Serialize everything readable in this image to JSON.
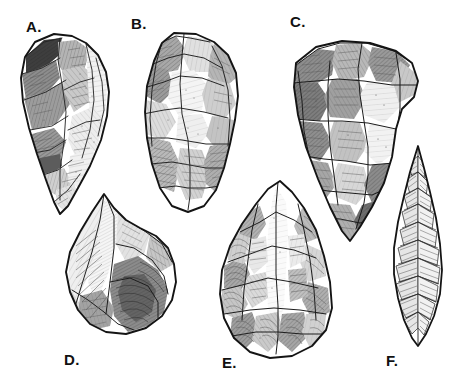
{
  "plate": {
    "title": "Lithic artifact illustration plate",
    "description": "Six hand-drawn archaeological stone tool (lithic) illustrations rendered in black ink hatching on white, each labeled with a letter.",
    "background_color": "#ffffff",
    "ink_color": "#1a1a1a",
    "width": 470,
    "height": 385
  },
  "figures": [
    {
      "id": "a",
      "label": "A.",
      "name": "pointed-biface",
      "description": "Elongated pointed biface, broad rounded butt at top tapering to a sharp tip at the bottom; heavily flaked left face with dark hatched scars.",
      "label_position": "top-left"
    },
    {
      "id": "b",
      "label": "B.",
      "name": "ovate-biface",
      "description": "Broad ovate biface with rounded upper margin and lightly tapered base; large central flake scar with radial hatching.",
      "label_position": "top-left"
    },
    {
      "id": "c",
      "label": "C.",
      "name": "triangular-biface",
      "description": "Large triangular biface, wide convex top edge narrowing steeply to a pointed base at lower left; deeply scalloped flake scars.",
      "label_position": "top-left"
    },
    {
      "id": "d",
      "label": "D.",
      "name": "levallois-core",
      "description": "Triangular Levallois-style core or flake shown in oblique view, apex at top with broad sweeping ridge hatching across the body.",
      "label_position": "bottom-left"
    },
    {
      "id": "e",
      "label": "E.",
      "name": "almond-handaxe",
      "description": "Almond-shaped (amygdaloid) handaxe with pointed top and broad rounded base, covered in overlapping crescent flake scars.",
      "label_position": "bottom-left"
    },
    {
      "id": "f",
      "label": "F.",
      "name": "lanceolate-point",
      "description": "Narrow elongated lanceolate point with a fine needle tip, densely covered in small parallel pressure-flake scars.",
      "label_position": "bottom-left"
    }
  ]
}
